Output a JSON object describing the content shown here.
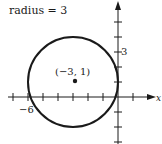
{
  "caption": "radius = 3",
  "center_label": "(−3, 1)",
  "tick_label_x": "−6",
  "tick_label_y": "3",
  "axis_label_x": "x",
  "circle": {
    "center": [
      -3,
      1
    ],
    "radius": 3
  },
  "colors": {
    "stroke": "#1a1a1a",
    "background": "#ffffff"
  }
}
